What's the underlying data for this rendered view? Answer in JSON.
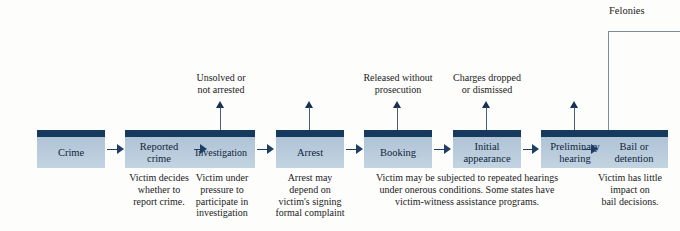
{
  "diagram": {
    "background_color": "#fdfdfc",
    "box_fill_color": "#b6c9da",
    "box_cap_color": "#153a5e",
    "arrow_color": "#1d3f63",
    "branch_line_color": "#7d8b9b"
  },
  "nodes": [
    {
      "id": "crime",
      "label": "Crime"
    },
    {
      "id": "reported-crime",
      "label": "Reported\ncrime"
    },
    {
      "id": "investigation",
      "label": "Investigation"
    },
    {
      "id": "arrest",
      "label": "Arrest"
    },
    {
      "id": "booking",
      "label": "Booking"
    },
    {
      "id": "initial-appearance",
      "label": "Initial\nappearance"
    },
    {
      "id": "preliminary-hearing",
      "label": "Preliminary\nhearing"
    },
    {
      "id": "bail-or-detention",
      "label": "Bail or\ndetention"
    }
  ],
  "exit_notes": [
    {
      "id": "unsolved-not-arrested",
      "text": "Unsolved or\nnot arrested"
    },
    {
      "id": "released-without-prosecution",
      "text": "Released without\nprosecution"
    },
    {
      "id": "charges-dropped-dismissed",
      "text": "Charges dropped\nor dismissed"
    }
  ],
  "captions": [
    {
      "id": "caption-reported-crime",
      "text": "Victim decides\nwhether to\nreport crime."
    },
    {
      "id": "caption-investigation",
      "text": "Victim under\npressure to\nparticipate in\ninvestigation"
    },
    {
      "id": "caption-arrest",
      "text": "Arrest may\ndepend on\nvictim's signing\nformal complaint"
    },
    {
      "id": "caption-middle-stages",
      "text": "Victim may be subjected to repeated hearings\nunder onerous conditions. Some states have\nvictim-witness assistance programs."
    },
    {
      "id": "caption-bail",
      "text": "Victim has little\nimpact on\nbail decisions."
    }
  ],
  "branch": {
    "label": "Felonies"
  }
}
